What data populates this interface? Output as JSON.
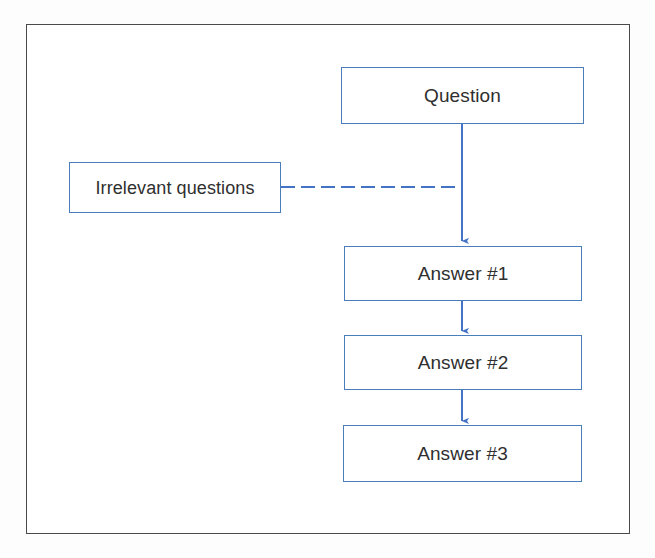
{
  "diagram": {
    "title_visible": false,
    "background_color": "#ffffff",
    "frame_color": "#4a4a4a",
    "node_border_color": "#4a7ebb",
    "connector_color": "#4472c4",
    "text_color": "#2f2f2f",
    "nodes": [
      {
        "id": "question",
        "label": "Question",
        "shape": "rectangle"
      },
      {
        "id": "irrelevant",
        "label": "Irrelevant questions",
        "shape": "rectangle"
      },
      {
        "id": "answer1",
        "label": "Answer #1",
        "shape": "rectangle"
      },
      {
        "id": "answer2",
        "label": "Answer #2",
        "shape": "rectangle"
      },
      {
        "id": "answer3",
        "label": "Answer #3",
        "shape": "rectangle"
      }
    ],
    "edges": [
      {
        "id": "edge-question-answer1",
        "from": "question",
        "to": "answer1",
        "style": "solid",
        "arrow": true
      },
      {
        "id": "edge-irrelevant-flow",
        "from": "irrelevant",
        "to": "question-answer1-link",
        "style": "dashed",
        "arrow": false
      },
      {
        "id": "edge-answer1-answer2",
        "from": "answer1",
        "to": "answer2",
        "style": "solid",
        "arrow": true
      },
      {
        "id": "edge-answer2-answer3",
        "from": "answer2",
        "to": "answer3",
        "style": "solid",
        "arrow": true
      }
    ]
  }
}
